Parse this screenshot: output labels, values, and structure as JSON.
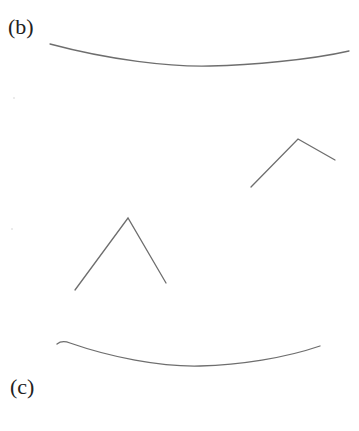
{
  "figure": {
    "panels": [
      {
        "id": "b",
        "label": "(b)"
      },
      {
        "id": "c",
        "label": "(c)"
      }
    ],
    "stroke_color": "#6e6e6e",
    "label_color": "#222222",
    "background": "#ffffff",
    "shapes": {
      "top_arc": {
        "type": "curve",
        "points": [
          [
            50,
            44
          ],
          [
            190,
            66
          ],
          [
            349,
            51
          ]
        ]
      },
      "upper_right_chevron": {
        "type": "polyline",
        "points": [
          [
            251,
            187
          ],
          [
            298,
            139
          ],
          [
            335,
            160
          ]
        ]
      },
      "lower_left_chevron": {
        "type": "polyline",
        "points": [
          [
            75,
            290
          ],
          [
            128,
            218
          ],
          [
            166,
            283
          ]
        ]
      },
      "bottom_arc": {
        "type": "curve",
        "points": [
          [
            57,
            343
          ],
          [
            190,
            366
          ],
          [
            320,
            346
          ]
        ]
      }
    }
  }
}
